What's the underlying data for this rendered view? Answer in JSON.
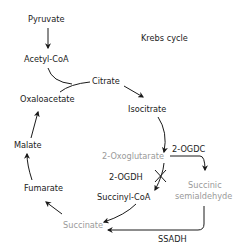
{
  "title": "Krebs cycle",
  "colors": {
    "normal": "#222222",
    "dimmed": "#9a9a9a",
    "line": "#1a1a1a"
  },
  "nodes": {
    "pyruvate": "Pyruvate",
    "acetyl_coa": "Acetyl-CoA",
    "citrate": "Citrate",
    "isocitrate": "Isocitrate",
    "oxoglutarate": "2-Oxoglutarate",
    "succinyl_coa": "Succinyl-CoA",
    "succinate": "Succinate",
    "fumarate": "Fumarate",
    "malate": "Malate",
    "oxaloacetate": "Oxaloacetate",
    "succinic_semialdehyde_line1": "Succinic",
    "succinic_semialdehyde_line2": "semialdehyde"
  },
  "enzymes": {
    "ogdc": "2-OGDC",
    "ogdh": "2-OGDH",
    "ssadh": "SSADH"
  },
  "blocked_steps": [
    "2-OGDH"
  ],
  "dimmed_nodes": [
    "2-Oxoglutarate",
    "Succinate",
    "Succinic semialdehyde"
  ]
}
